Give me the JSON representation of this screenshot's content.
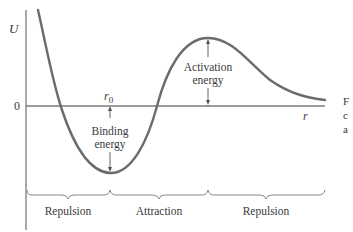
{
  "diagram": {
    "axes": {
      "y_label": "U",
      "x_label": "r",
      "zero_label": "0",
      "equilibrium_label": "r",
      "equilibrium_subscript": "0"
    },
    "annotations": {
      "binding_energy": [
        "Binding",
        "energy"
      ],
      "activation_energy": [
        "Activation",
        "energy"
      ]
    },
    "regions": [
      {
        "label": "Repulsion"
      },
      {
        "label": "Attraction"
      },
      {
        "label": "Repulsion"
      }
    ],
    "cropped_caption_fragments": [
      "F",
      "c",
      "a"
    ],
    "colors": {
      "curve": "#6b6b6b",
      "axis": "#7a7a7a",
      "text": "#3a3a3a",
      "background": "#ffffff"
    }
  }
}
